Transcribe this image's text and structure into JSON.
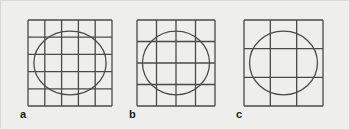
{
  "figure": {
    "name": "mesh-refinement-ellipse-figure",
    "background_color": "#eeeeec",
    "border_color": "#d8d8d4",
    "line_color": "#4a4a4a",
    "ellipse_color": "#4a4a4a",
    "panels": [
      {
        "id": "a",
        "label": "a",
        "grid_columns": 5,
        "grid_rows": 5,
        "shape": "ellipse",
        "ellipse_cx_pct": 50,
        "ellipse_cy_pct": 50,
        "ellipse_rx_pct": 43,
        "ellipse_ry_pct": 37
      },
      {
        "id": "b",
        "label": "b",
        "grid_columns": 4,
        "grid_rows": 4,
        "shape": "ellipse",
        "ellipse_cx_pct": 50,
        "ellipse_cy_pct": 50,
        "ellipse_rx_pct": 43,
        "ellipse_ry_pct": 37
      },
      {
        "id": "c",
        "label": "c",
        "grid_columns": 3,
        "grid_rows": 3,
        "shape": "ellipse",
        "ellipse_cx_pct": 50,
        "ellipse_cy_pct": 50,
        "ellipse_rx_pct": 43,
        "ellipse_ry_pct": 37
      }
    ]
  }
}
